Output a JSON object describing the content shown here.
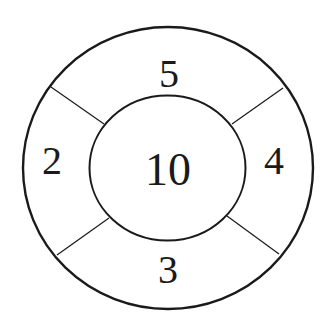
{
  "diagram": {
    "center_value": "10",
    "segments": {
      "top": "5",
      "left": "2",
      "right": "4",
      "bottom": "3"
    },
    "stroke_color": "#1a1a1a",
    "background": "#ffffff"
  }
}
